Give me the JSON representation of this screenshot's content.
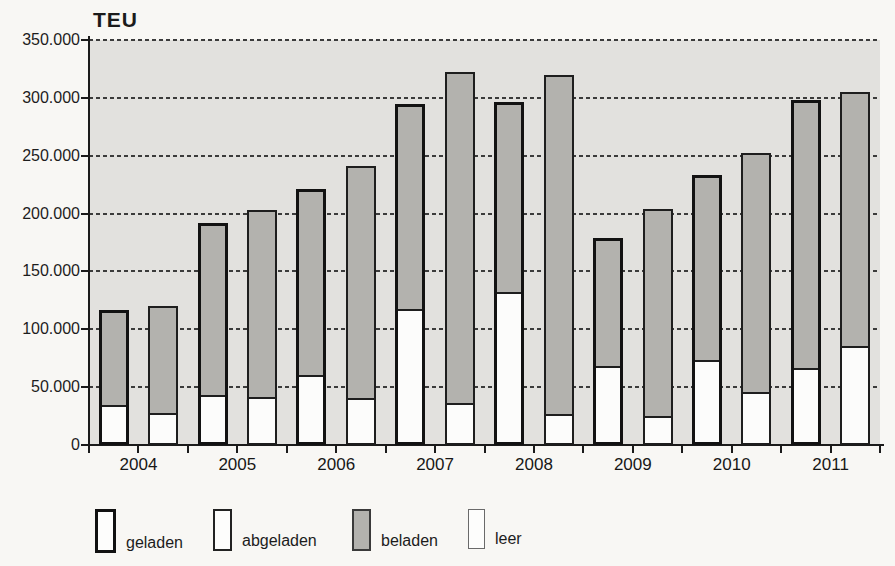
{
  "chart_data": {
    "type": "bar",
    "subtype": "paired-stacked-columns",
    "title": "TEU",
    "unit": "TEU",
    "categories": [
      "2004",
      "2005",
      "2006",
      "2007",
      "2008",
      "2009",
      "2010",
      "2011"
    ],
    "ylim": [
      0,
      350000
    ],
    "ytick_interval": 50000,
    "ytick_labels": [
      "350.000",
      "300.000",
      "250.000",
      "200.000",
      "150.000",
      "100.000",
      "50.000",
      "0"
    ],
    "grid": "dashed-horizontal",
    "legend_position": "bottom",
    "legend": [
      {
        "key": "geladen",
        "label": "geladen",
        "meaning": "bar-outline-thick"
      },
      {
        "key": "abgeladen",
        "label": "abgeladen",
        "meaning": "bar-outline-thin"
      },
      {
        "key": "beladen",
        "label": "beladen",
        "meaning": "segment-fill-gray"
      },
      {
        "key": "leer",
        "label": "leer",
        "meaning": "segment-fill-white"
      }
    ],
    "series": [
      {
        "name": "geladen",
        "outline": "thick",
        "total": [
          117000,
          192000,
          221000,
          295000,
          296000,
          179000,
          233000,
          298000
        ],
        "leer": [
          30000,
          39000,
          56000,
          113000,
          128000,
          64000,
          69000,
          62000
        ],
        "beladen": [
          87000,
          153000,
          165000,
          182000,
          168000,
          115000,
          164000,
          236000
        ]
      },
      {
        "name": "abgeladen",
        "outline": "thin",
        "total": [
          120000,
          203000,
          241000,
          322000,
          320000,
          204000,
          252000,
          305000
        ],
        "leer": [
          24000,
          38000,
          37000,
          33000,
          23000,
          22000,
          42000,
          82000
        ],
        "beladen": [
          96000,
          165000,
          204000,
          289000,
          297000,
          182000,
          210000,
          223000
        ]
      }
    ],
    "colors": {
      "beladen_fill": "#b3b2ae",
      "leer_fill": "#fcfcfb",
      "plot_background": "#e2e1de",
      "page_background": "#f8f7f4",
      "axis": "#1b1b1b"
    }
  }
}
